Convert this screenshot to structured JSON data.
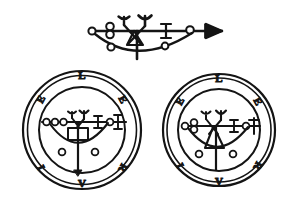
{
  "plate": {
    "background_color": "#ffffff",
    "ink_color": "#141414",
    "width": 299,
    "height": 212,
    "caption": ""
  },
  "top_sigil": {
    "name": "leraje-line-sigil",
    "description": "Horizontal bar sigil terminating in an arrowhead, with circles, a forked Y glyph, a triangle, an I glyph and a pendant crescent arc",
    "stroke_color": "#141414",
    "elements": [
      {
        "id": "baseline",
        "type": "horizontal-bar"
      },
      {
        "id": "arrowhead",
        "type": "arrowhead",
        "side": "right"
      },
      {
        "id": "left-terminal-circle",
        "type": "circle"
      },
      {
        "id": "double-circle-stack",
        "type": "circle-pair"
      },
      {
        "id": "fork-glyph",
        "type": "y-fork"
      },
      {
        "id": "triangle-glyph",
        "type": "triangle"
      },
      {
        "id": "i-glyph",
        "type": "serif-i"
      },
      {
        "id": "right-circle",
        "type": "circle"
      },
      {
        "id": "crescent-arc",
        "type": "arc"
      },
      {
        "id": "arc-left-circle",
        "type": "circle"
      },
      {
        "id": "arc-right-circle",
        "type": "circle"
      },
      {
        "id": "stem",
        "type": "vertical-stem"
      }
    ]
  },
  "seals": [
    {
      "id": "left-seal",
      "name": "leraje-seal-variant-a",
      "center_glyph": "square",
      "letters": [
        {
          "char": "L",
          "position": "top",
          "angle_deg": 0
        },
        {
          "char": "E",
          "position": "upper-right",
          "angle_deg": 60
        },
        {
          "char": "R",
          "position": "lower-right",
          "angle_deg": 120
        },
        {
          "char": "V",
          "position": "bottom",
          "angle_deg": 180
        },
        {
          "char": "I",
          "position": "lower-left",
          "angle_deg": 240
        },
        {
          "char": "E",
          "position": "upper-left",
          "angle_deg": 300
        }
      ],
      "ring_count": 3
    },
    {
      "id": "right-seal",
      "name": "leraje-seal-variant-b",
      "center_glyph": "triangle",
      "letters": [
        {
          "char": "L",
          "position": "top",
          "angle_deg": 0
        },
        {
          "char": "E",
          "position": "upper-right",
          "angle_deg": 60
        },
        {
          "char": "R",
          "position": "lower-right",
          "angle_deg": 120
        },
        {
          "char": "V",
          "position": "bottom",
          "angle_deg": 180
        },
        {
          "char": "I",
          "position": "lower-left",
          "angle_deg": 240
        },
        {
          "char": "E",
          "position": "upper-left",
          "angle_deg": 300
        }
      ],
      "ring_count": 3
    }
  ]
}
